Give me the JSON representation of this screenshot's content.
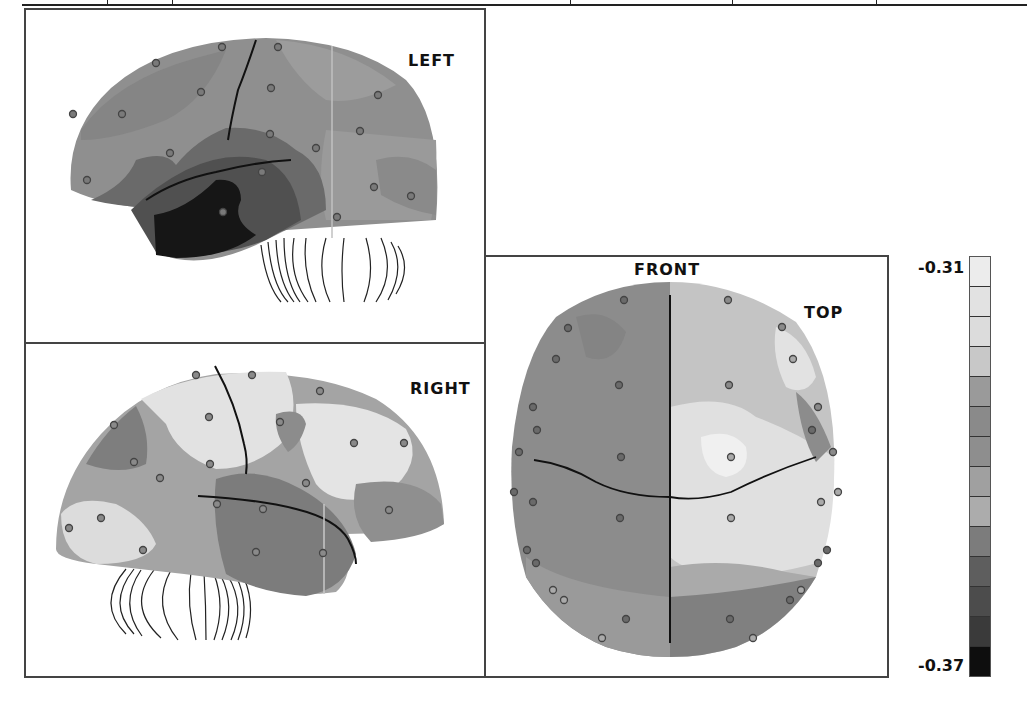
{
  "figure": {
    "panels": [
      {
        "id": "left",
        "label": "LEFT"
      },
      {
        "id": "right",
        "label": "RIGHT"
      },
      {
        "id": "top",
        "label": "TOP",
        "orientation_label": "FRONT"
      }
    ],
    "colorbar": {
      "max_label": "-0.31",
      "min_label": "-0.37",
      "levels": [
        "#ececec",
        "#e2e2e2",
        "#dcdcdc",
        "#c8c8c8",
        "#9a9a9a",
        "#8a8a8a",
        "#8e8e8e",
        "#a0a0a0",
        "#acacac",
        "#7c7c7c",
        "#5e5e5e",
        "#4c4c4c",
        "#3a3a3a",
        "#0e0e0e"
      ]
    }
  },
  "chart_data": {
    "type": "heatmap",
    "title": "",
    "views": [
      "LEFT",
      "RIGHT",
      "TOP"
    ],
    "orientation_labels": [
      "FRONT"
    ],
    "colorbar_range": [
      -0.37,
      -0.31
    ],
    "colorbar_levels": 14,
    "colorbar_ticks": [
      "-0.31",
      "-0.37"
    ],
    "electrodes": "scalp EEG electrode positions shown as small circles"
  }
}
